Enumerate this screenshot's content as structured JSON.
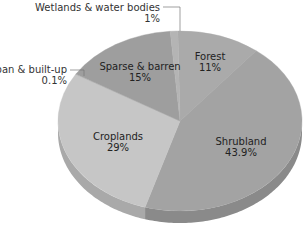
{
  "chart_data": {
    "type": "pie",
    "style": "3d-tilted",
    "title": "",
    "categories": [
      "Forest",
      "Shrubland",
      "Croplands",
      "Urban & built-up",
      "Sparse & barren",
      "Wetlands & water bodies"
    ],
    "values": [
      11,
      43.9,
      29,
      0.1,
      15,
      1
    ],
    "value_labels": [
      "11%",
      "43.9%",
      "29%",
      "0.1%",
      "15%",
      "1%"
    ],
    "colors": [
      "#aaaaaa",
      "#a3a3a3",
      "#c6c6c6",
      "#bdbdbd",
      "#9e9e9e",
      "#b4b4b4"
    ],
    "side_colors": [
      "#8f8f8f",
      "#8a8a8a",
      "#a9a9a9",
      "#a0a0a0",
      "#858585",
      "#989898"
    ],
    "legend": "none",
    "start_angle_deg": -91,
    "direction": "clockwise"
  },
  "labels": {
    "forest": {
      "name": "Forest",
      "value": "11%"
    },
    "shrubland": {
      "name": "Shrubland",
      "value": "43.9%"
    },
    "croplands": {
      "name": "Croplands",
      "value": "29%"
    },
    "urban": {
      "name": "Urban & built-up",
      "value": "0.1%"
    },
    "sparse": {
      "name": "Sparse & barren",
      "value": "15%"
    },
    "wetlands": {
      "name": "Wetlands & water bodies",
      "value": "1%"
    }
  }
}
